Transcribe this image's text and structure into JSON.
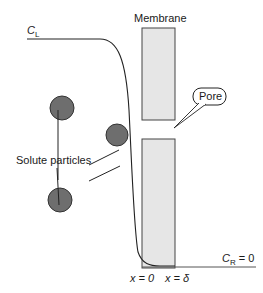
{
  "diagram": {
    "labels": {
      "c_left": {
        "symbol": "C",
        "subscript": "L"
      },
      "c_right": {
        "symbol": "C",
        "subscript": "R",
        "suffix": " = 0"
      },
      "membrane": "Membrane",
      "pore": "Pore",
      "solute_particles": "Solute particles",
      "x_zero": "x = 0",
      "x_delta": "x = δ"
    },
    "colors": {
      "membrane_fill": "#e6e6e6",
      "membrane_stroke": "#444444",
      "particle_fill": "#6e6e6e",
      "particle_stroke": "#333333",
      "line": "#222222"
    },
    "particles": [
      {
        "cx": 62,
        "cy": 108,
        "r": 12
      },
      {
        "cx": 117,
        "cy": 135,
        "r": 11
      },
      {
        "cx": 60,
        "cy": 200,
        "r": 12
      }
    ]
  }
}
